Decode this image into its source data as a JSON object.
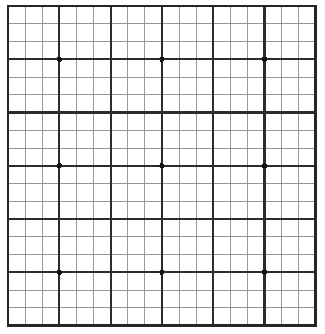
{
  "figure": {
    "type": "grid-target",
    "background_color": "#ffffff"
  },
  "chart_data": {
    "type": "heatmap",
    "subtitle": "",
    "xlabel": "",
    "ylabel": "",
    "grid": true,
    "legend_position": "none",
    "axis_ranges": {
      "x": [
        0,
        18
      ],
      "y": [
        0,
        18
      ]
    },
    "tick_labels": {
      "x": [],
      "y": []
    },
    "annotations": [],
    "categories": [],
    "values": [],
    "series": [
      {
        "name": "registration-dots",
        "marker": "filled-square-dot",
        "marker_color": "#1a1a1a",
        "marker_size_px": 5,
        "points": [
          {
            "x": 3,
            "y": 3
          },
          {
            "x": 9,
            "y": 3
          },
          {
            "x": 15,
            "y": 3
          },
          {
            "x": 3,
            "y": 9
          },
          {
            "x": 9,
            "y": 9
          },
          {
            "x": 15,
            "y": 9
          },
          {
            "x": 3,
            "y": 15
          },
          {
            "x": 9,
            "y": 15
          },
          {
            "x": 15,
            "y": 15
          }
        ]
      }
    ]
  },
  "grid": {
    "columns": 18,
    "rows": 18,
    "major_every": 3,
    "origin_x": 8,
    "origin_y": 6,
    "cell_width": 17.1,
    "cell_height": 17.75,
    "minor_line_color": "#8c8c8c",
    "minor_line_width": 0.9,
    "major_line_color": "#2b2b2b",
    "major_line_width": 2.1,
    "border_color": "#262626",
    "border_width": 2.6,
    "dot_color": "#141414",
    "dot_radius": 2.6
  }
}
